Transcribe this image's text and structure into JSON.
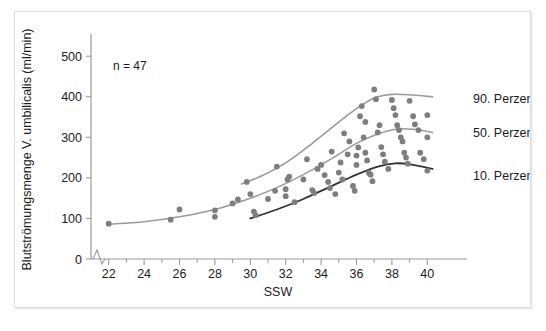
{
  "figure": {
    "annotation": "n = 47",
    "xlabel": "SSW",
    "ylabel": "Blutströmungsmenge V. umbilicalis (ml/min)"
  },
  "colors": {
    "point": "#7e7e7e",
    "curve_light": "#9a9a9a",
    "curve_dark": "#333333",
    "axis": "#9a9a9a",
    "text": "#1b1b1b",
    "frame": "#dcdcdc",
    "background": "#ffffff"
  },
  "legend": {
    "position": "right",
    "items": [
      {
        "label": "90. Perzentile",
        "color": "#9a9a9a",
        "y_value": 395
      },
      {
        "label": "50. Perzentile",
        "color": "#9a9a9a",
        "y_value": 313
      },
      {
        "label": "10. Perzentile",
        "color": "#333333",
        "y_value": 205
      }
    ]
  },
  "chart_data": {
    "type": "scatter",
    "title": "",
    "xlabel": "SSW",
    "ylabel": "Blutströmungsmenge V. umbilicalis (ml/min)",
    "xlim": [
      21,
      41
    ],
    "ylim": [
      0,
      540
    ],
    "grid": false,
    "axis_break_y_at": 0,
    "n": 47,
    "xticks": [
      22,
      24,
      26,
      28,
      30,
      32,
      34,
      36,
      38,
      40
    ],
    "xticks_minor": [
      23,
      25,
      27,
      29,
      31,
      33,
      35,
      37,
      39
    ],
    "yticks": [
      0,
      100,
      200,
      300,
      400,
      500
    ],
    "points": [
      [
        22.0,
        87
      ],
      [
        25.5,
        97
      ],
      [
        26.0,
        122
      ],
      [
        28.0,
        120
      ],
      [
        28.0,
        104
      ],
      [
        29.0,
        137
      ],
      [
        29.3,
        147
      ],
      [
        29.8,
        190
      ],
      [
        30.0,
        160
      ],
      [
        30.2,
        117
      ],
      [
        30.3,
        108
      ],
      [
        31.0,
        148
      ],
      [
        31.4,
        168
      ],
      [
        31.5,
        228
      ],
      [
        32.0,
        172
      ],
      [
        32.0,
        155
      ],
      [
        32.1,
        196
      ],
      [
        32.2,
        203
      ],
      [
        32.5,
        140
      ],
      [
        33.0,
        196
      ],
      [
        33.2,
        246
      ],
      [
        33.5,
        170
      ],
      [
        33.6,
        163
      ],
      [
        33.8,
        222
      ],
      [
        34.0,
        232
      ],
      [
        34.2,
        207
      ],
      [
        34.4,
        190
      ],
      [
        34.5,
        175
      ],
      [
        34.6,
        265
      ],
      [
        34.8,
        160
      ],
      [
        35.0,
        213
      ],
      [
        35.1,
        238
      ],
      [
        35.2,
        196
      ],
      [
        35.3,
        310
      ],
      [
        35.5,
        258
      ],
      [
        35.6,
        290
      ],
      [
        35.8,
        180
      ],
      [
        35.9,
        168
      ],
      [
        36.0,
        255
      ],
      [
        36.0,
        232
      ],
      [
        36.1,
        275
      ],
      [
        36.2,
        352
      ],
      [
        36.3,
        377
      ],
      [
        36.4,
        300
      ],
      [
        36.5,
        338
      ],
      [
        36.5,
        262
      ],
      [
        36.6,
        243
      ],
      [
        36.7,
        212
      ],
      [
        36.8,
        208
      ],
      [
        36.9,
        192
      ],
      [
        37.0,
        418
      ],
      [
        37.1,
        394
      ],
      [
        37.2,
        312
      ],
      [
        37.3,
        330
      ],
      [
        37.4,
        276
      ],
      [
        37.5,
        258
      ],
      [
        37.6,
        240
      ],
      [
        37.8,
        222
      ],
      [
        38.0,
        392
      ],
      [
        38.1,
        372
      ],
      [
        38.2,
        355
      ],
      [
        38.3,
        330
      ],
      [
        38.4,
        318
      ],
      [
        38.5,
        300
      ],
      [
        38.6,
        290
      ],
      [
        38.7,
        262
      ],
      [
        38.8,
        250
      ],
      [
        38.9,
        235
      ],
      [
        39.0,
        390
      ],
      [
        39.2,
        352
      ],
      [
        39.3,
        332
      ],
      [
        39.5,
        318
      ],
      [
        39.6,
        262
      ],
      [
        39.8,
        246
      ],
      [
        40.0,
        355
      ],
      [
        40.0,
        300
      ],
      [
        40.0,
        218
      ]
    ],
    "series": [
      {
        "name": "90. Perzentile",
        "type": "line",
        "color": "#9a9a9a",
        "width": 1.6,
        "x": [
          29.5,
          30.5,
          31.5,
          32.5,
          33.5,
          34.5,
          35.5,
          36.5,
          37.2,
          38.0,
          39.0,
          40.3
        ],
        "y": [
          185,
          202,
          224,
          252,
          285,
          320,
          355,
          385,
          400,
          406,
          405,
          400
        ]
      },
      {
        "name": "50. Perzentile",
        "type": "line",
        "color": "#9a9a9a",
        "width": 1.6,
        "x": [
          22.0,
          24.0,
          26.0,
          28.0,
          30.0,
          31.5,
          33.0,
          34.5,
          36.0,
          37.2,
          38.2,
          39.2,
          40.3
        ],
        "y": [
          86,
          92,
          104,
          122,
          150,
          176,
          208,
          245,
          285,
          308,
          320,
          320,
          312
        ]
      },
      {
        "name": "10. Perzentile",
        "type": "line",
        "color": "#333333",
        "width": 1.8,
        "x": [
          30.0,
          31.5,
          33.0,
          34.5,
          36.0,
          37.2,
          38.2,
          39.2,
          40.3
        ],
        "y": [
          100,
          122,
          148,
          178,
          208,
          228,
          236,
          232,
          222
        ]
      }
    ]
  }
}
